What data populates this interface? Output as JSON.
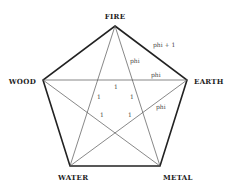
{
  "vertices": {
    "fire": "FIRE",
    "earth": "EARTH",
    "metal": "METAL",
    "water": "WATER",
    "wood": "WOOD"
  },
  "annotations": {
    "side": "phi + 1",
    "star_upper": "phi",
    "chord": "phi",
    "star_lower": "phi",
    "inner": [
      "1",
      "1",
      "1",
      "1",
      "1"
    ]
  }
}
